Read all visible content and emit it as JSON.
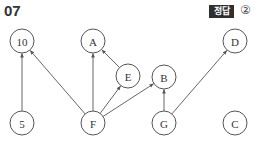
{
  "header": {
    "question_number": "07",
    "answer_label": "정답",
    "answer_value": "②"
  },
  "diagram": {
    "node_radius": 12,
    "nodes": [
      {
        "id": "10",
        "label": "10",
        "x": 22,
        "y": 41
      },
      {
        "id": "A",
        "label": "A",
        "x": 93,
        "y": 41
      },
      {
        "id": "E",
        "label": "E",
        "x": 128,
        "y": 76
      },
      {
        "id": "B",
        "label": "B",
        "x": 164,
        "y": 77
      },
      {
        "id": "D",
        "label": "D",
        "x": 235,
        "y": 41
      },
      {
        "id": "5",
        "label": "5",
        "x": 22,
        "y": 123
      },
      {
        "id": "F",
        "label": "F",
        "x": 93,
        "y": 123
      },
      {
        "id": "G",
        "label": "G",
        "x": 164,
        "y": 123
      },
      {
        "id": "C",
        "label": "C",
        "x": 235,
        "y": 123
      }
    ],
    "edges": [
      {
        "from": "5",
        "to": "10"
      },
      {
        "from": "F",
        "to": "10"
      },
      {
        "from": "F",
        "to": "A"
      },
      {
        "from": "F",
        "to": "E"
      },
      {
        "from": "E",
        "to": "A"
      },
      {
        "from": "F",
        "to": "B"
      },
      {
        "from": "G",
        "to": "B"
      },
      {
        "from": "G",
        "to": "D"
      }
    ],
    "colors": {
      "stroke": "#555555",
      "text": "#333333",
      "badge_bg": "#2f2f2f"
    }
  }
}
